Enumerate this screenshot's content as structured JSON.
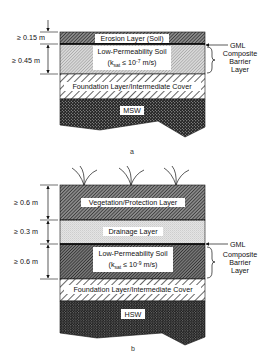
{
  "diagram_a": {
    "caption": "a",
    "dimensions": [
      {
        "label": "≥ 0.15 m",
        "layer": "erosion"
      },
      {
        "label": "≥ 0.45 m",
        "layer": "low_permeability"
      }
    ],
    "layers": {
      "erosion": "Erosion Layer (Soil)",
      "low_permeability_line1": "Low-Permeability Soil",
      "low_permeability_line2": "(ksat ≤ 10-7 m/s)",
      "ksat_k": "k",
      "ksat_sub": "sat",
      "ksat_rest": " ≤ 10",
      "ksat_exp": "-7",
      "ksat_unit": " m/s)",
      "foundation": "Foundation Layer/Intermediate Cover",
      "waste": "MSW"
    },
    "side_labels": {
      "gml": "GML",
      "barrier_line1": "Composite",
      "barrier_line2": "Barrier",
      "barrier_line3": "Layer"
    }
  },
  "diagram_b": {
    "caption": "b",
    "dimensions": [
      {
        "label": "≥ 0.6 m",
        "layer": "vegetation"
      },
      {
        "label": "≥ 0.3 m",
        "layer": "drainage"
      },
      {
        "label": "≥ 0.6 m",
        "layer": "low_permeability"
      }
    ],
    "layers": {
      "vegetation": "Vegetation/Protection Layer",
      "drainage": "Drainage Layer",
      "low_permeability_line1": "Low-Permeability Soil",
      "ksat_k": "k",
      "ksat_sub": "sat",
      "ksat_rest": " ≤ 10",
      "ksat_exp": "-9",
      "ksat_unit": " m/s)",
      "foundation": "Foundation Layer/Intermediate Cover",
      "waste": "HSW"
    },
    "side_labels": {
      "gml": "GML",
      "barrier_line1": "Composite",
      "barrier_line2": "Barrier",
      "barrier_line3": "Layer"
    }
  }
}
